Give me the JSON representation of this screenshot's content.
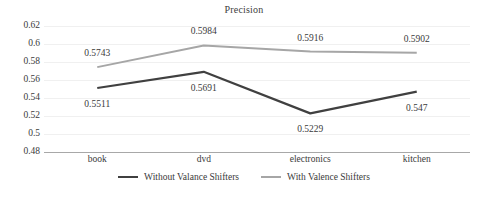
{
  "chart_data": {
    "type": "line",
    "title": "Precision",
    "xlabel": "",
    "ylabel": "",
    "categories": [
      "book",
      "dvd",
      "electronics",
      "kitchen"
    ],
    "ylim": [
      0.48,
      0.62
    ],
    "ytick_labels": [
      "0.62",
      "0.6",
      "0.58",
      "0.56",
      "0.54",
      "0.52",
      "0.5",
      "0.48"
    ],
    "ytick_values": [
      0.62,
      0.6,
      0.58,
      0.56,
      0.54,
      0.52,
      0.5,
      0.48
    ],
    "grid": true,
    "legend_position": "bottom",
    "series": [
      {
        "name": "Without Valance Shifters",
        "color": "#404040",
        "values": [
          0.5511,
          0.5691,
          0.5229,
          0.547
        ],
        "value_labels": [
          "0.5511",
          "0.5691",
          "0.5229",
          "0.547"
        ]
      },
      {
        "name": "With Valence Shifters",
        "color": "#a6a6a6",
        "values": [
          0.5743,
          0.5984,
          0.5916,
          0.5902
        ],
        "value_labels": [
          "0.5743",
          "0.5984",
          "0.5916",
          "0.5902"
        ]
      }
    ]
  }
}
